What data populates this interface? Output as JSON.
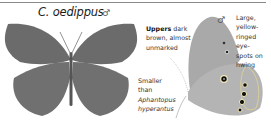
{
  "species_title": "C. oedippus",
  "male_symbol": "♂",
  "upperside": {
    "sex": "♂",
    "annotation_bold": "Uppers",
    "annotation_rest_1": " dark",
    "annotation_line_2": "brown, almost",
    "annotation_line_3": "unmarked"
  },
  "size_note": {
    "line_1": "Smaller",
    "line_2": "than",
    "line_3": "Aphantopus",
    "line_4": "hyperantus"
  },
  "underside": {
    "sex": "♂",
    "annotation_lines": [
      "Large,",
      "yellow-",
      "ringed eye-",
      "spots on",
      "hwing"
    ]
  },
  "colors": {
    "upper_wing": "#6b6b6b",
    "under_wing": "#a9a9a9",
    "rule": "#8a8a8a"
  }
}
